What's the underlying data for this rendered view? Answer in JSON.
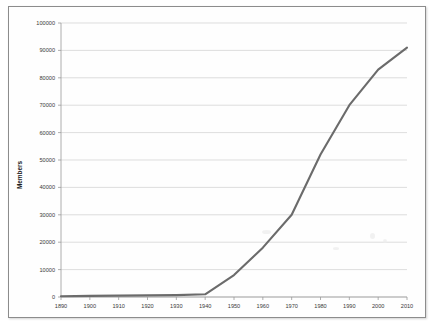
{
  "figure": {
    "background_color": "#ffffff",
    "frame_color": "#8c8c8c"
  },
  "chart_data": {
    "type": "line",
    "title": "",
    "subtitle": "",
    "xlabel": "",
    "ylabel": "Members",
    "x": [
      1890,
      1900,
      1910,
      1920,
      1930,
      1940,
      1950,
      1960,
      1970,
      1980,
      1990,
      2000,
      2010
    ],
    "values": [
      300,
      400,
      500,
      600,
      700,
      1000,
      8000,
      18000,
      30000,
      52000,
      70000,
      83000,
      91000
    ],
    "series": [
      {
        "name": "Members",
        "color": "#6b6b6b",
        "values": [
          300,
          400,
          500,
          600,
          700,
          1000,
          8000,
          18000,
          30000,
          52000,
          70000,
          83000,
          91000
        ]
      }
    ],
    "xlim": [
      1890,
      2010
    ],
    "ylim": [
      0,
      100000
    ],
    "xticks": [
      1890,
      1900,
      1910,
      1920,
      1930,
      1940,
      1950,
      1960,
      1970,
      1980,
      1990,
      2000,
      2010
    ],
    "yticks": [
      0,
      10000,
      20000,
      30000,
      40000,
      50000,
      60000,
      70000,
      80000,
      90000,
      100000
    ],
    "xtick_labels": [
      "1890",
      "1900",
      "1910",
      "1920",
      "1930",
      "1940",
      "1950",
      "1960",
      "1970",
      "1980",
      "1990",
      "2000",
      "2010"
    ],
    "ytick_labels": [
      "0",
      "10000",
      "20000",
      "30000",
      "40000",
      "50000",
      "60000",
      "70000",
      "80000",
      "90000",
      "100000"
    ],
    "grid": "horizontal",
    "legend": "none",
    "line_color": "#6b6b6b",
    "gridline_color": "#d0d0d0",
    "axis_color": "#9a9a9a"
  },
  "axes": {
    "y_axis_title": "Members"
  }
}
